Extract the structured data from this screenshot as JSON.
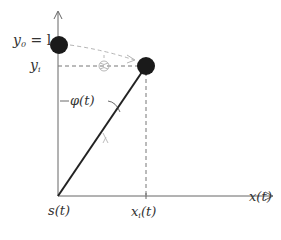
{
  "diagram": {
    "colors": {
      "axis": "#666666",
      "rod": "#222222",
      "mass": "#1a1a1a",
      "dashed": "#777777",
      "faint": "#b5b5b5",
      "text": "#333333"
    },
    "axes": {
      "x_label": "x(t)",
      "origin_label": "s(t)"
    },
    "labels": {
      "y0_eq_l": {
        "base": "y",
        "sub": "0",
        "rest": " = l"
      },
      "yi": {
        "base": "y",
        "sub": "i",
        "rest": ""
      },
      "xi": {
        "base": "x",
        "sub": "i",
        "rest": "(t)"
      },
      "phi": "φ(t)",
      "x_axis": "x(t)",
      "origin": "s(t)"
    },
    "elements": {
      "initial_mass": {
        "cx": 59,
        "cy": 45,
        "r": 9
      },
      "current_mass": {
        "cx": 146,
        "cy": 66,
        "r": 9
      },
      "pivot": {
        "x": 58,
        "y": 196
      }
    }
  }
}
